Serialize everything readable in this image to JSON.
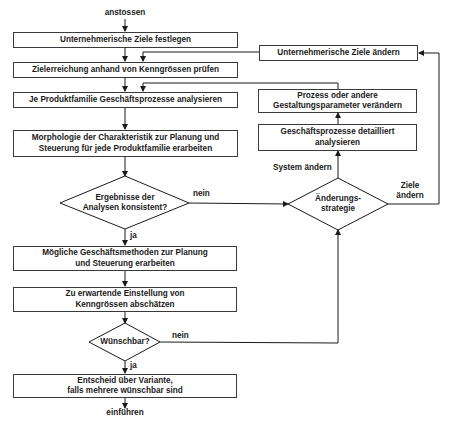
{
  "diagram": {
    "start_label": "anstossen",
    "end_label": "einführen",
    "main_steps": [
      "Unternehmerische Ziele festlegen",
      "Zielerreichung anhand von Kenngrössen prüfen",
      "Je Produktfamilie Geschäftsprozesse analysieren",
      "Morphologie der Charakteristik zur Planung und\nSteuerung für jede Produktfamilie erarbeiten",
      "Mögliche Geschäftsmethoden zur Planung\nund Steuerung erarbeiten",
      "Zu erwartende Einstellung von\nKenngrössen abschätzen",
      "Entscheid über Variante,\nfalls mehrere wünschbar sind"
    ],
    "decisions": {
      "consistent": {
        "text": "Ergebnisse der\nAnalysen konsistent?",
        "yes": "ja",
        "no": "nein"
      },
      "desirable": {
        "text": "Wünschbar?",
        "yes": "ja",
        "no": "nein"
      },
      "strategy": {
        "text": "Änderungs-\nstrategie",
        "system_branch": "System ändern",
        "goals_branch": "Ziele\nändern"
      }
    },
    "side_steps": [
      "Unternehmerische Ziele ändern",
      "Prozess oder andere\nGestaltungsparameter verändern",
      "Geschäftsprozesse detailliert\nanalysieren"
    ]
  }
}
